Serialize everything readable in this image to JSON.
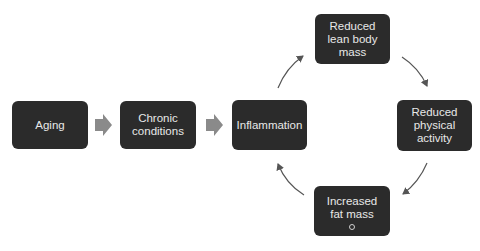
{
  "diagram": {
    "nodes": [
      {
        "id": "aging",
        "label": "Aging"
      },
      {
        "id": "chronic",
        "label": "Chronic conditions"
      },
      {
        "id": "inflammation",
        "label": "Inflammation"
      },
      {
        "id": "lean",
        "label": "Reduced lean body mass"
      },
      {
        "id": "activity",
        "label": "Reduced physical activity"
      },
      {
        "id": "fat",
        "label": "Increased fat mass"
      }
    ],
    "edges": [
      {
        "from": "aging",
        "to": "chronic",
        "style": "block-arrow"
      },
      {
        "from": "chronic",
        "to": "inflammation",
        "style": "block-arrow"
      },
      {
        "from": "inflammation",
        "to": "lean",
        "style": "curved-arrow"
      },
      {
        "from": "lean",
        "to": "activity",
        "style": "curved-arrow"
      },
      {
        "from": "activity",
        "to": "fat",
        "style": "curved-arrow"
      },
      {
        "from": "fat",
        "to": "inflammation",
        "style": "curved-arrow"
      }
    ],
    "colors": {
      "node_fill": "#2b2b2b",
      "node_text": "#e8e8e8",
      "block_arrow": "#8a8a8a",
      "curved_arrow": "#555555"
    }
  }
}
